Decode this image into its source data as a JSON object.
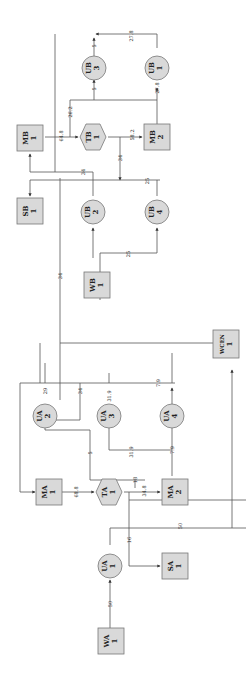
{
  "diagram": {
    "orientation": "rotated 90deg clockwise (text reads bottom-to-top)",
    "nodes": {
      "WA1": {
        "name": "WA",
        "num": "1",
        "shape": "square"
      },
      "UA1": {
        "name": "UA",
        "num": "1",
        "shape": "circle"
      },
      "SA1": {
        "name": "SA",
        "num": "1",
        "shape": "square"
      },
      "MA1": {
        "name": "MA",
        "num": "1",
        "shape": "square"
      },
      "TA1": {
        "name": "TA",
        "num": "1",
        "shape": "hexagon"
      },
      "MA2": {
        "name": "MA",
        "num": "2",
        "shape": "square"
      },
      "UA2": {
        "name": "UA",
        "num": "2",
        "shape": "circle"
      },
      "UA3": {
        "name": "UA",
        "num": "3",
        "shape": "circle"
      },
      "UA4": {
        "name": "UA",
        "num": "4",
        "shape": "circle"
      },
      "WCEN1": {
        "name": "WCEN",
        "num": "1",
        "shape": "square"
      },
      "WB1": {
        "name": "WB",
        "num": "1",
        "shape": "square"
      },
      "UB2": {
        "name": "UB",
        "num": "2",
        "shape": "circle"
      },
      "UB4": {
        "name": "UB",
        "num": "4",
        "shape": "circle"
      },
      "SB1": {
        "name": "SB",
        "num": "1",
        "shape": "square"
      },
      "MB1": {
        "name": "MB",
        "num": "1",
        "shape": "square"
      },
      "TB1": {
        "name": "TB",
        "num": "1",
        "shape": "hexagon"
      },
      "MB2": {
        "name": "MB",
        "num": "2",
        "shape": "square"
      },
      "UB1": {
        "name": "UB",
        "num": "1",
        "shape": "circle"
      },
      "UB3": {
        "name": "UB",
        "num": "3",
        "shape": "circle"
      }
    },
    "edge_labels": {
      "wa1_ua1": "50",
      "ua1_split_a": "16",
      "ua1_wcen": "50",
      "ma1_ta1": "68.8",
      "ta1_sa1": "18",
      "ta1_ma2": "34.8",
      "to_ua3": "31.9",
      "ma2_ua4": "7.9",
      "ua4_out": "7.9",
      "ua3_out": "31.9",
      "ua2_in": "29",
      "ua2_mid": "34",
      "ua2_loop": "5",
      "ua_to_ub": "34",
      "wb1_ub4": "25",
      "ub4_out": "25",
      "ub2_out": "34",
      "mb1_tb1": "64.8",
      "tb_recycle": "26.2",
      "tb1_mb2": "58.2",
      "tb1_split": "34",
      "mb2_ub1": "27.8",
      "ub1_out": "27.8",
      "to_ub3": "5",
      "ub3_out": "5"
    }
  }
}
